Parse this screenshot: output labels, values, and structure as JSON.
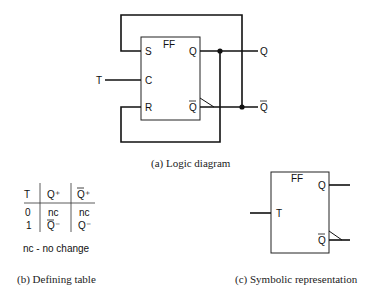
{
  "logic_diagram": {
    "block_label": "FF",
    "pins": {
      "S": "S",
      "C": "C",
      "R": "R",
      "Q": "Q",
      "Qbar": "Q"
    },
    "input_label": "T",
    "output_q": "Q",
    "output_qbar": "Q",
    "caption": "(a) Logic diagram"
  },
  "defining_table": {
    "headers": [
      "T",
      "Q⁺",
      "Q⁺"
    ],
    "rows": [
      [
        "0",
        "nc",
        "nc"
      ],
      [
        "1",
        "Q⁻",
        "Q⁻"
      ]
    ],
    "note": "nc - no change",
    "caption": "(b) Defining table"
  },
  "symbolic": {
    "block_label": "FF",
    "input_label": "T",
    "out_q": "Q",
    "out_qbar": "Q",
    "caption": "(c) Symbolic representation"
  }
}
